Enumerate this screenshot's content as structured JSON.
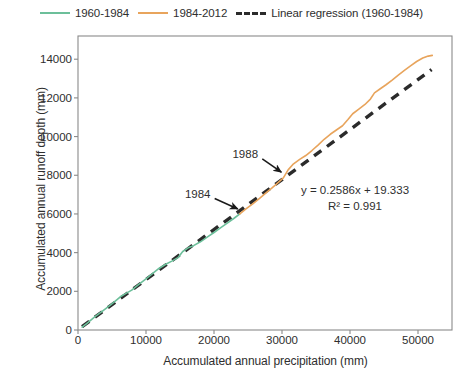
{
  "chart_data": {
    "type": "line",
    "title": "",
    "xlabel": "Accumulated annual precipitation (mm)",
    "ylabel": "Accumulated annual runoff depth (mm)",
    "xlim": [
      0,
      55000
    ],
    "ylim": [
      0,
      15200
    ],
    "xticks": [
      0,
      10000,
      20000,
      30000,
      40000,
      50000
    ],
    "xticklabels": [
      "0",
      "10000",
      "20000",
      "30000",
      "40000",
      "50000"
    ],
    "yticks": [
      0,
      2000,
      4000,
      6000,
      8000,
      10000,
      12000,
      14000
    ],
    "yticklabels": [
      "0",
      "2000",
      "4000",
      "6000",
      "8000",
      "10000",
      "12000",
      "14000"
    ],
    "grid": false,
    "legend_position": "top",
    "series": [
      {
        "name": "1960-1984",
        "color": "#6CBF9A",
        "style": "solid",
        "points": [
          [
            600,
            150
          ],
          [
            1500,
            400
          ],
          [
            2500,
            690
          ],
          [
            3600,
            980
          ],
          [
            4700,
            1270
          ],
          [
            5700,
            1560
          ],
          [
            6400,
            1760
          ],
          [
            7000,
            1880
          ],
          [
            7900,
            2060
          ],
          [
            8800,
            2320
          ],
          [
            9900,
            2620
          ],
          [
            10900,
            2900
          ],
          [
            11900,
            3180
          ],
          [
            12900,
            3400
          ],
          [
            13800,
            3560
          ],
          [
            14700,
            3740
          ],
          [
            15400,
            4060
          ],
          [
            16200,
            4250
          ],
          [
            17000,
            4360
          ],
          [
            18000,
            4560
          ],
          [
            19000,
            4800
          ],
          [
            20000,
            5040
          ],
          [
            21000,
            5290
          ],
          [
            22000,
            5540
          ],
          [
            23000,
            5790
          ],
          [
            23800,
            6000
          ]
        ]
      },
      {
        "name": "1984-2012",
        "color": "#E8A45C",
        "style": "solid",
        "points": [
          [
            23800,
            6000
          ],
          [
            24700,
            6260
          ],
          [
            25700,
            6520
          ],
          [
            26700,
            6800
          ],
          [
            27600,
            7080
          ],
          [
            28500,
            7340
          ],
          [
            29300,
            7580
          ],
          [
            30200,
            7860
          ],
          [
            30900,
            8280
          ],
          [
            31600,
            8560
          ],
          [
            32600,
            8820
          ],
          [
            33500,
            9020
          ],
          [
            34400,
            9280
          ],
          [
            35300,
            9560
          ],
          [
            36200,
            9860
          ],
          [
            37100,
            10120
          ],
          [
            38000,
            10340
          ],
          [
            38900,
            10560
          ],
          [
            39700,
            10880
          ],
          [
            40400,
            11180
          ],
          [
            41300,
            11420
          ],
          [
            42200,
            11660
          ],
          [
            43000,
            11940
          ],
          [
            43600,
            12260
          ],
          [
            44400,
            12460
          ],
          [
            45300,
            12680
          ],
          [
            46200,
            12920
          ],
          [
            47100,
            13180
          ],
          [
            48000,
            13420
          ],
          [
            48900,
            13660
          ],
          [
            49800,
            13880
          ],
          [
            50700,
            14060
          ],
          [
            51500,
            14160
          ],
          [
            52100,
            14200
          ]
        ]
      }
    ],
    "regression": {
      "name": "Linear regression (1960-1984)",
      "color": "#2b2b2b",
      "style": "dashed",
      "slope": 0.2586,
      "intercept": 19.333,
      "r_squared": 0.991,
      "equation_text": "y = 0.2586x + 19.333",
      "r2_text": "R² = 0.991",
      "x_range": [
        600,
        52000
      ]
    },
    "annotations": [
      {
        "label": "1984",
        "point_x": 23800,
        "point_y": 6000,
        "text_x": 17600,
        "text_y": 6850
      },
      {
        "label": "1988",
        "point_x": 30200,
        "point_y": 7900,
        "text_x": 24600,
        "text_y": 8900
      }
    ]
  },
  "legend": {
    "entries": [
      {
        "label": "1960-1984",
        "color": "#6CBF9A",
        "style": "solid"
      },
      {
        "label": "1984-2012",
        "color": "#E8A45C",
        "style": "solid"
      },
      {
        "label": "Linear regression (1960-1984)",
        "color": "#2b2b2b",
        "style": "dashed"
      }
    ]
  }
}
